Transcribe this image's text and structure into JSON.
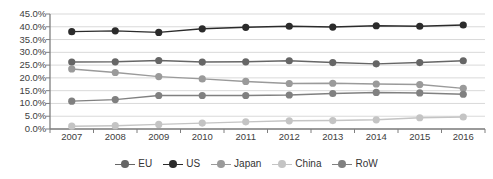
{
  "chart_data": {
    "type": "line",
    "title": "",
    "xlabel": "",
    "ylabel": "",
    "categories": [
      "2007",
      "2008",
      "2009",
      "2010",
      "2011",
      "2012",
      "2013",
      "2014",
      "2015",
      "2016"
    ],
    "x": [
      2007,
      2008,
      2009,
      2010,
      2011,
      2012,
      2013,
      2014,
      2015,
      2016
    ],
    "ylim": [
      0,
      45
    ],
    "ytick_labels": [
      "0.0%",
      "5.0%",
      "10.0%",
      "15.0%",
      "20.0%",
      "25.0%",
      "30.0%",
      "35.0%",
      "40.0%",
      "45.0%"
    ],
    "ytick_values": [
      0,
      5,
      10,
      15,
      20,
      25,
      30,
      35,
      40,
      45
    ],
    "grid": true,
    "legend_position": "bottom",
    "value_suffix": "%",
    "series": [
      {
        "name": "EU",
        "color": "#666666",
        "values": [
          26.2,
          26.3,
          26.8,
          26.2,
          26.3,
          26.7,
          26.0,
          25.5,
          26.0,
          26.7
        ]
      },
      {
        "name": "US",
        "color": "#2b2b2b",
        "values": [
          38.1,
          38.4,
          37.8,
          39.2,
          39.8,
          40.2,
          39.9,
          40.4,
          40.2,
          40.7
        ]
      },
      {
        "name": "Japan",
        "color": "#9a9a9a",
        "values": [
          23.5,
          22.1,
          20.5,
          19.6,
          18.6,
          17.8,
          17.9,
          17.6,
          17.4,
          15.9
        ]
      },
      {
        "name": "China",
        "color": "#c4c4c4",
        "values": [
          1.1,
          1.3,
          1.8,
          2.3,
          2.8,
          3.2,
          3.3,
          3.6,
          4.4,
          4.7
        ]
      },
      {
        "name": "RoW",
        "color": "#808080",
        "values": [
          10.9,
          11.5,
          13.1,
          13.1,
          13.1,
          13.3,
          13.9,
          14.3,
          14.1,
          13.6
        ]
      }
    ]
  },
  "axis": {
    "gridline_color": "#d9d9d9",
    "axis_line_color": "#7f7f7f"
  }
}
